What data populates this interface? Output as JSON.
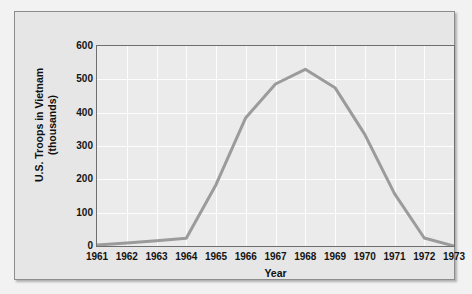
{
  "chart_data": {
    "type": "line",
    "title": "",
    "xlabel": "Year",
    "ylabel": "U.S. Troops in Vietnam (thousands)",
    "ylabel_line1": "U.S. Troops in Vietnam",
    "ylabel_line2": "(thousands)",
    "categories": [
      "1961",
      "1962",
      "1963",
      "1964",
      "1965",
      "1966",
      "1967",
      "1968",
      "1969",
      "1970",
      "1971",
      "1972",
      "1973"
    ],
    "x": [
      1961,
      1962,
      1963,
      1964,
      1965,
      1966,
      1967,
      1968,
      1969,
      1970,
      1971,
      1972,
      1973
    ],
    "values": [
      3,
      9,
      16,
      23,
      184,
      385,
      486,
      530,
      475,
      335,
      157,
      24,
      0
    ],
    "series": [
      {
        "name": "U.S. Troops in Vietnam",
        "values": [
          3,
          9,
          16,
          23,
          184,
          385,
          486,
          530,
          475,
          335,
          157,
          24,
          0
        ],
        "color": "#9b9b9b"
      }
    ],
    "ylim": [
      0,
      600
    ],
    "yticks": [
      0,
      100,
      200,
      300,
      400,
      500,
      600
    ],
    "ytick_labels": [
      "0",
      "100",
      "200",
      "300",
      "400",
      "500",
      "600"
    ],
    "xlim": [
      1961,
      1973
    ],
    "grid": true,
    "grid_color": "#fdfdfd",
    "legend": "none",
    "plot_background": "#ebebeb",
    "figure_background": "#e6e6e6",
    "line_color": "#9b9b9b",
    "line_width": 3,
    "axis_color": "#6e6e6e"
  }
}
